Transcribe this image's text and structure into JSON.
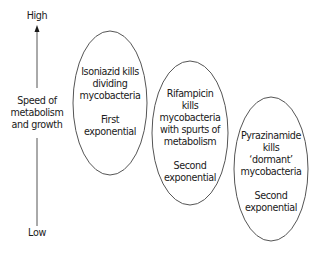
{
  "axis": {
    "high_label": "High",
    "low_label": "Low",
    "title_lines": [
      "Speed of",
      "metabolism",
      "and growth"
    ],
    "direction": "up-arrow"
  },
  "ellipses": [
    {
      "lines": [
        "Isoniazid kills",
        "dividing",
        "mycobacteria"
      ],
      "phase": [
        "First",
        "exponential"
      ]
    },
    {
      "lines": [
        "Rifampicin",
        "kills",
        "mycobacteria",
        "with spurts of",
        "metabolism"
      ],
      "phase": [
        "Second",
        "exponential"
      ]
    },
    {
      "lines": [
        "Pyrazinamide",
        "kills",
        "‘dormant’",
        "mycobacteria"
      ],
      "phase": [
        "Second",
        "exponential"
      ]
    }
  ],
  "colors": {
    "stroke": "#555555",
    "text": "#1a1a1a",
    "background": "#ffffff"
  }
}
